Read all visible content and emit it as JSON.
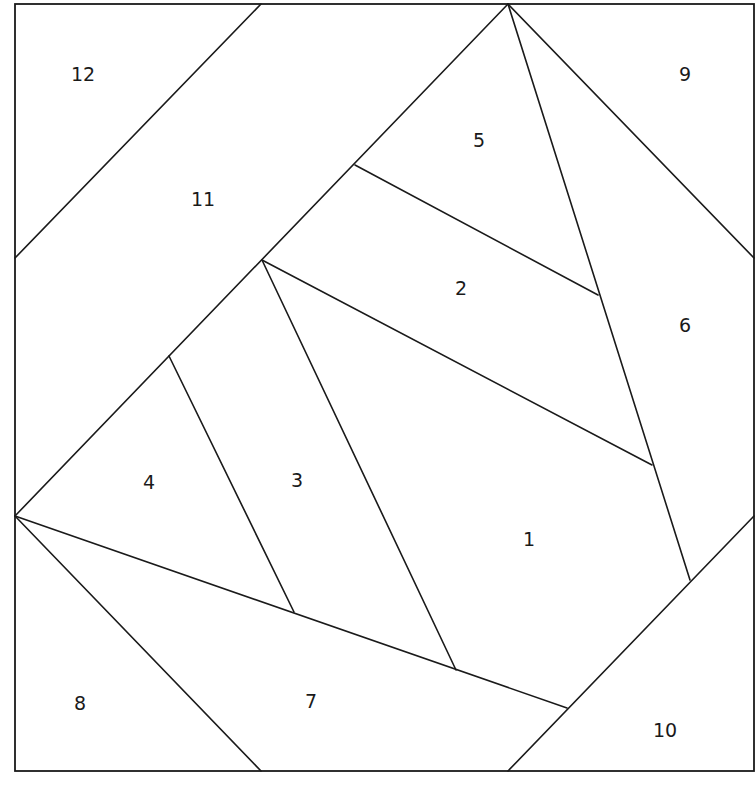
{
  "diagram": {
    "type": "foundation-paper-piecing-pattern",
    "colors": {
      "line": "#1a1a1a",
      "background": "#ffffff"
    },
    "pieces": [
      {
        "label": "1",
        "x": 529,
        "y": 540
      },
      {
        "label": "2",
        "x": 461,
        "y": 289
      },
      {
        "label": "3",
        "x": 297,
        "y": 481
      },
      {
        "label": "4",
        "x": 149,
        "y": 483
      },
      {
        "label": "5",
        "x": 479,
        "y": 141
      },
      {
        "label": "6",
        "x": 685,
        "y": 326
      },
      {
        "label": "7",
        "x": 311,
        "y": 702
      },
      {
        "label": "8",
        "x": 80,
        "y": 704
      },
      {
        "label": "9",
        "x": 685,
        "y": 75
      },
      {
        "label": "10",
        "x": 665,
        "y": 731
      },
      {
        "label": "11",
        "x": 203,
        "y": 200
      },
      {
        "label": "12",
        "x": 83,
        "y": 75
      }
    ]
  }
}
